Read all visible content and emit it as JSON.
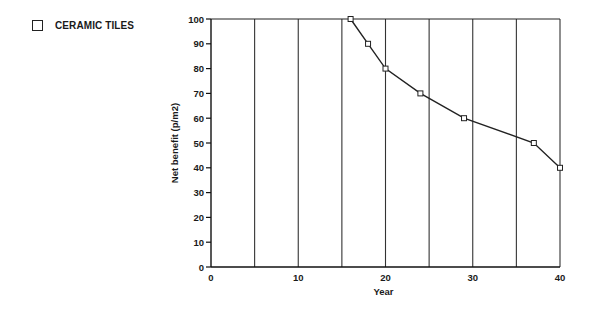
{
  "legend": {
    "items": [
      {
        "label": "CERAMIC TILES",
        "marker": "open-square"
      }
    ]
  },
  "chart_data": {
    "type": "line",
    "title": "",
    "xlabel": "Year",
    "ylabel": "Net benefit  (p/m2)",
    "xlim": [
      0,
      40
    ],
    "ylim": [
      0,
      100
    ],
    "x_ticks": [
      0,
      10,
      20,
      30,
      40
    ],
    "y_ticks": [
      0,
      10,
      20,
      30,
      40,
      50,
      60,
      70,
      80,
      90,
      100
    ],
    "vertical_gridlines": [
      5,
      10,
      15,
      20,
      25,
      30,
      35,
      40
    ],
    "grid": "vertical only",
    "legend_position": "top-left, outside plot",
    "series": [
      {
        "name": "CERAMIC TILES",
        "marker": "open-square",
        "x": [
          16,
          18,
          20,
          24,
          29,
          37,
          40
        ],
        "values": [
          100,
          90,
          80,
          70,
          60,
          50,
          40
        ]
      }
    ]
  }
}
